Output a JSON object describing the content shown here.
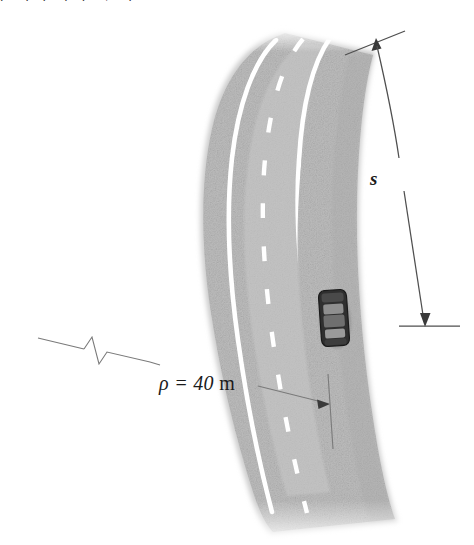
{
  "figure": {
    "name": "curved-road-with-car-diagram",
    "background_color": "#ffffff"
  },
  "clipped_caption": {
    "text": "p q p j p y q",
    "note": "bottom descender remnants of a caption cropped off the top edge"
  },
  "annotations": {
    "arc_label": "s",
    "radius_label_symbol": "ρ",
    "radius_label_equals": " = ",
    "radius_label_value": "40",
    "radius_label_unit": "m",
    "radius_label_full": "ρ = 40 m"
  },
  "road": {
    "surface_color": "#b9b9b9",
    "surface_color_light": "#cfcfcf",
    "lane_marking_color": "#ffffff",
    "lane_count": 2,
    "center_line_style": "dashed",
    "edge_line_style": "solid",
    "dash_count": 9
  },
  "car": {
    "body_color": "#2e2e2e",
    "window_color": "#8d8d8d",
    "orientation": "heading-up",
    "lane": "right-lane",
    "x": 334,
    "y": 318
  },
  "dimension_lines": {
    "arc_stroke_color": "#4a4a4a",
    "leader_stroke_color": "#6b6b6b",
    "break_symbol": "zigzag",
    "arrow_top_direction": "up",
    "arrow_bottom_direction": "down",
    "arrow_radius_direction": "right"
  }
}
